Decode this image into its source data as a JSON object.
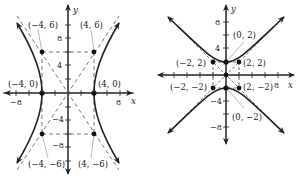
{
  "graphs": [
    {
      "name": "left-hyperbola",
      "equation_type": "horizontal-transverse hyperbola",
      "axis_labels": {
        "x": "x",
        "y": "y"
      },
      "x_ticks": {
        "neg": "−8",
        "pos": "8"
      },
      "y_ticks": {
        "p8": "8",
        "p4": "4",
        "m4": "−4",
        "m8": "−8"
      },
      "points": {
        "vertex_left": "(−4, 0)",
        "vertex_right": "(4, 0)",
        "box_tl": "(−4, 6)",
        "box_tr": "(4, 6)",
        "box_bl": "(−4, −6)",
        "box_br": "(4, −6)"
      }
    },
    {
      "name": "right-hyperbola",
      "equation_type": "vertical-transverse hyperbola",
      "axis_labels": {
        "x": "x",
        "y": "y"
      },
      "x_ticks": {
        "pos": "8"
      },
      "y_ticks": {
        "p8": "8",
        "p4": "4",
        "m4": "−4",
        "m8": "−8"
      },
      "points": {
        "vertex_top": "(0, 2)",
        "vertex_bottom": "(0, −2)",
        "box_tl": "(−2, 2)",
        "box_tr": "(2, 2)",
        "box_bl": "(−2, −2)",
        "box_br": "(2, −2)"
      }
    }
  ],
  "colors": {
    "ink": "#222222",
    "dashed": "#555555",
    "leader": "#888888"
  }
}
